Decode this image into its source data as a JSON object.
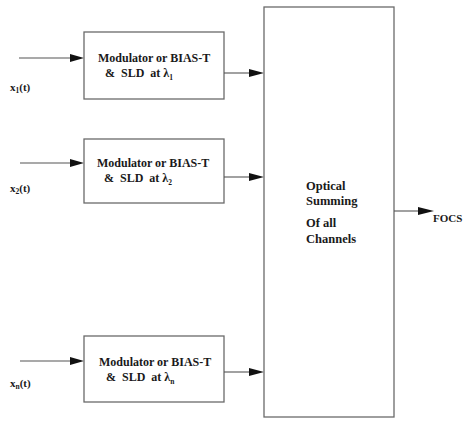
{
  "diagram": {
    "type": "block-diagram",
    "channels": [
      {
        "input_label": "x",
        "input_subscript": "1",
        "input_suffix": "(t)",
        "block_line1": "Modulator or BIAS-T",
        "block_line2_prefix": "&  SLD  at ",
        "lambda": "λ",
        "lambda_subscript": "1"
      },
      {
        "input_label": "x",
        "input_subscript": "2",
        "input_suffix": "(t)",
        "block_line1": "Modulator or BIAS-T",
        "block_line2_prefix": "&  SLD  at ",
        "lambda": "λ",
        "lambda_subscript": "2"
      },
      {
        "input_label": "x",
        "input_subscript": "n",
        "input_suffix": "(t)",
        "block_line1": "Modulator or BIAS-T",
        "block_line2_prefix": "&  SLD  at ",
        "lambda": "λ",
        "lambda_subscript": "n"
      }
    ],
    "summing_block": {
      "line1": "Optical",
      "line2": "Summing",
      "line3": "Of all",
      "line4": "Channels"
    },
    "output_label": "FOCS",
    "colors": {
      "line": "#555555",
      "box_border": "#6a6a6a",
      "arrowhead": "#111111",
      "text": "#1a1a1a"
    }
  }
}
